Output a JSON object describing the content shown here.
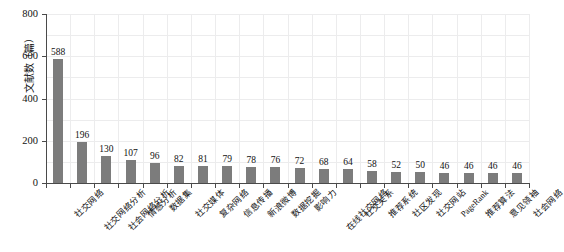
{
  "chart_data": {
    "type": "bar",
    "title": "",
    "xlabel": "",
    "ylabel": "文献数（篇）",
    "ylim": [
      0,
      800
    ],
    "yticks": [
      0,
      200,
      400,
      600,
      800
    ],
    "grid": true,
    "legend": false,
    "orientation": "vertical",
    "bar_color": "#7c7c7c",
    "categories": [
      "社交网络",
      "社交网络分析",
      "社会网络分析",
      "情感分析",
      "数据集",
      "社交媒体",
      "复杂网络",
      "信息传播",
      "新浪微博",
      "数据挖掘",
      "影响力",
      "在线社交网络",
      "社交关系",
      "推荐系统",
      "社区发现",
      "社交网站",
      "PageRank",
      "推荐算法",
      "意见领袖",
      "社会网络"
    ],
    "values": [
      588,
      196,
      130,
      107,
      96,
      82,
      81,
      79,
      78,
      76,
      72,
      68,
      64,
      58,
      52,
      50,
      46,
      46,
      46,
      46
    ],
    "value_labels": [
      "588",
      "196",
      "130",
      "107",
      "96",
      "82",
      "81",
      "79",
      "78",
      "76",
      "72",
      "68",
      "64",
      "58",
      "52",
      "50",
      "46",
      "46",
      "46",
      "46"
    ],
    "ytick_labels": [
      "0",
      "200",
      "400",
      "600",
      "800"
    ]
  }
}
